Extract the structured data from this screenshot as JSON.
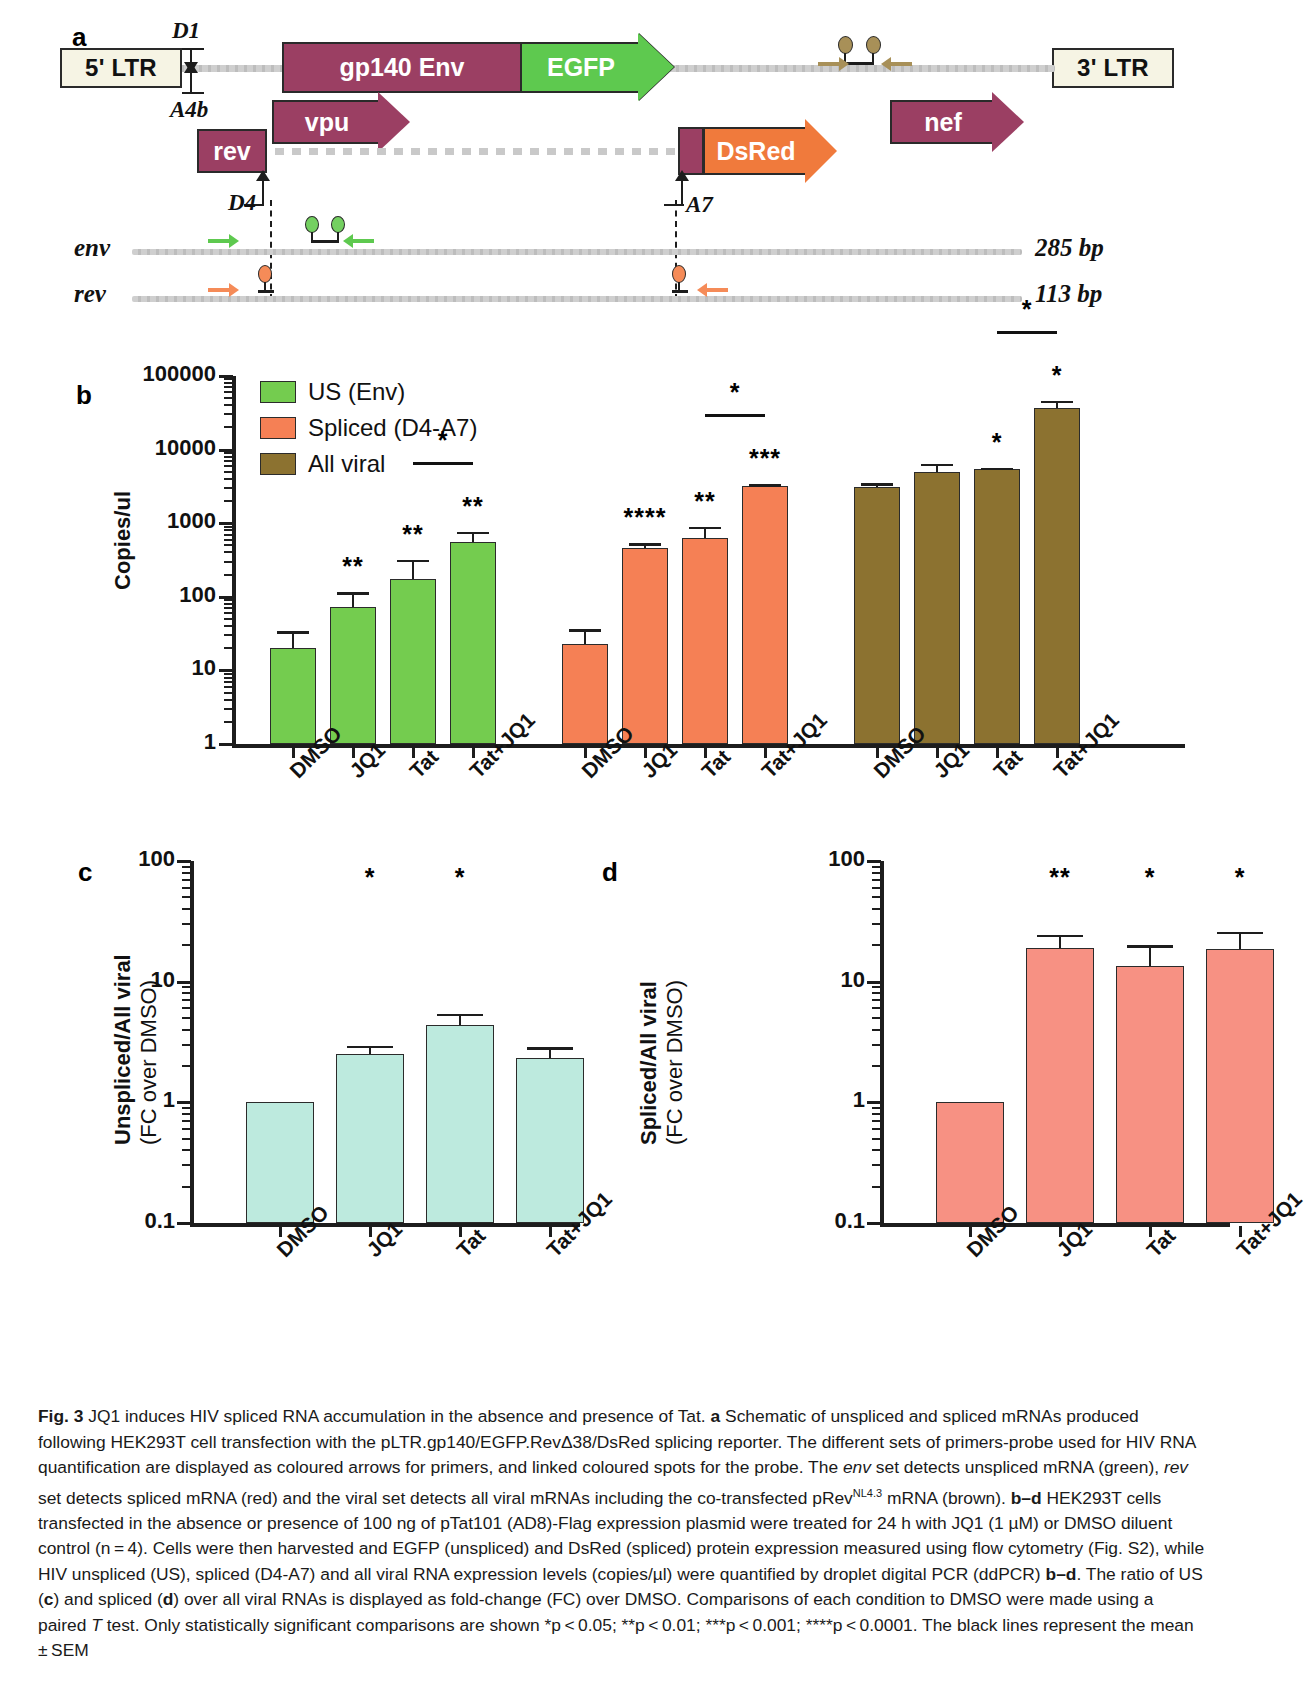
{
  "figure": {
    "id": "Fig. 3",
    "caption_lead": "JQ1 induces HIV spliced RNA accumulation in the absence and presence of Tat.",
    "caption_a": "Schematic of unspliced and spliced mRNAs produced following HEK293T cell transfection with the pLTR.gp140/EGFP.RevΔ38/DsRed splicing reporter. The different sets of primers-probe used for HIV RNA quantification are displayed as coloured arrows for primers, and linked coloured spots for the probe. The",
    "caption_a2": "set detects unspliced mRNA (green),",
    "caption_a3": "set detects spliced mRNA (red) and the viral set detects all viral mRNAs including the co-transfected pRev",
    "caption_a3_sup": "NL4.3",
    "caption_a4": "mRNA (brown).",
    "caption_bd": "HEK293T cells transfected in the absence or presence of 100 ng of pTat101 (AD8)-Flag expression plasmid were treated for 24 h with JQ1 (1 µM) or DMSO diluent control (n = 4). Cells were then harvested and EGFP (unspliced) and DsRed (spliced) protein expression measured using flow cytometry (Fig. S2), while HIV unspliced (US), spliced (D4-A7) and all viral RNA expression levels (copies/µl) were quantified by droplet digital PCR (ddPCR)",
    "caption_bd2": ". The ratio of US (",
    "caption_bd3": ") and spliced (",
    "caption_bd4": ") over all viral RNAs is displayed as fold-change (FC) over DMSO. Comparisons of each condition to DMSO were made using a paired",
    "caption_bd5": "test. Only statistically significant comparisons are shown *p < 0.05; **p < 0.01; ***p < 0.001; ****p < 0.0001. The black lines represent the mean ± SEM",
    "italic_env": "env",
    "italic_rev": "rev",
    "italic_T": "T",
    "bold_a": "a",
    "bold_bd": "b–d",
    "bold_c": "c",
    "bold_d": "d"
  },
  "panel_a": {
    "letter": "a",
    "ltr5_label": "5' LTR",
    "ltr3_label": "3' LTR",
    "genes": [
      {
        "name": "gp140 Env",
        "color": "#9b3f63"
      },
      {
        "name": "EGFP",
        "color": "#5ec94f"
      },
      {
        "name": "vpu",
        "color": "#9b3f63"
      },
      {
        "name": "nef",
        "color": "#9b3f63"
      },
      {
        "name": "rev",
        "color": "#9b3f63"
      },
      {
        "name": "DsRed",
        "color": "#f07a3c"
      }
    ],
    "splice_sites": [
      "D1",
      "A4b",
      "D4",
      "A7"
    ],
    "transcripts": [
      {
        "name": "env",
        "size": "285 bp",
        "primer_color": "#5ec94f",
        "probe_color": "#74d061"
      },
      {
        "name": "rev",
        "size": "113 bp",
        "primer_color": "#f58b58",
        "probe_color": "#f58b58"
      }
    ],
    "viral_probe_color": "#a89058"
  },
  "panel_b": {
    "letter": "b",
    "legend": [
      {
        "label": "US (Env)",
        "color": "#74cc4f"
      },
      {
        "label": "Spliced (D4-A7)",
        "color": "#f58055"
      },
      {
        "label": "All viral",
        "color": "#8c7230"
      }
    ]
  },
  "panel_c": {
    "letter": "c"
  },
  "panel_d": {
    "letter": "d"
  },
  "chart_data": [
    {
      "type": "bar",
      "panel": "b",
      "title": "",
      "ylabel": "Copies/ul",
      "xlabel": "",
      "yscale": "log",
      "ylim": [
        1,
        100000
      ],
      "yticks": [
        1,
        10,
        100,
        1000,
        10000,
        100000
      ],
      "ytick_labels": [
        "1",
        "10",
        "100",
        "1000",
        "10000",
        "100000"
      ],
      "grid": false,
      "legend_position": "top-left",
      "categories": [
        "DMSO",
        "JQ1",
        "Tat",
        "Tat+JQ1"
      ],
      "groups": [
        {
          "name": "US (Env)",
          "color": "#74cc4f",
          "values": [
            20,
            72,
            175,
            560
          ],
          "err_low": [
            12,
            50,
            110,
            430
          ],
          "err_high": [
            34,
            115,
            320,
            770
          ],
          "significance": [
            "",
            "**",
            "**",
            "**"
          ],
          "comparison_bar": {
            "from": "Tat",
            "to": "Tat+JQ1",
            "label": "*"
          }
        },
        {
          "name": "Spliced (D4-A7)",
          "color": "#f58055",
          "values": [
            23,
            460,
            620,
            3200
          ],
          "err_low": [
            17,
            390,
            430,
            3000
          ],
          "err_high": [
            36,
            530,
            900,
            3400
          ],
          "significance": [
            "",
            "****",
            "**",
            "***"
          ],
          "comparison_bar": {
            "from": "Tat",
            "to": "Tat+JQ1",
            "label": "*"
          }
        },
        {
          "name": "All viral",
          "color": "#8c7230",
          "values": [
            3100,
            5000,
            5400,
            37000
          ],
          "err_low": [
            2800,
            4200,
            5100,
            31000
          ],
          "err_high": [
            3500,
            6400,
            5700,
            46000
          ],
          "significance": [
            "",
            "",
            "*",
            "*"
          ],
          "comparison_bar": {
            "from": "Tat",
            "to": "Tat+JQ1",
            "label": "*"
          }
        }
      ]
    },
    {
      "type": "bar",
      "panel": "c",
      "title": "",
      "ylabel": "Unspliced/All viral (FC over DMSO)",
      "ylabel_line1": "Unspliced/All viral",
      "ylabel_line2": "(FC over DMSO)",
      "xlabel": "",
      "yscale": "log",
      "ylim": [
        0.1,
        100
      ],
      "yticks": [
        0.1,
        1,
        10,
        100
      ],
      "ytick_labels": [
        "0.1",
        "1",
        "10",
        "100"
      ],
      "grid": false,
      "color": "#bdeade",
      "categories": [
        "DMSO",
        "JQ1",
        "Tat",
        "Tat+JQ1"
      ],
      "values": [
        1.0,
        2.5,
        4.4,
        2.35
      ],
      "err_low": [
        1.0,
        2.2,
        3.7,
        2.0
      ],
      "err_high": [
        1.0,
        2.95,
        5.4,
        2.85
      ],
      "significance": [
        "",
        "*",
        "*",
        ""
      ]
    },
    {
      "type": "bar",
      "panel": "d",
      "title": "",
      "ylabel": "Spliced/All viral (FC over DMSO)",
      "ylabel_line1": "Spliced/All viral",
      "ylabel_line2": "(FC over DMSO)",
      "xlabel": "",
      "yscale": "log",
      "ylim": [
        0.1,
        100
      ],
      "yticks": [
        0.1,
        1,
        10,
        100
      ],
      "ytick_labels": [
        "0.1",
        "1",
        "10",
        "100"
      ],
      "grid": false,
      "color": "#f79183",
      "categories": [
        "DMSO",
        "JQ1",
        "Tat",
        "Tat+JQ1"
      ],
      "values": [
        1.0,
        19.0,
        13.5,
        18.8
      ],
      "err_low": [
        1.0,
        16.5,
        11.0,
        15.5
      ],
      "err_high": [
        1.0,
        24.5,
        20.0,
        26.0
      ],
      "significance": [
        "",
        "**",
        "*",
        "*"
      ]
    }
  ]
}
